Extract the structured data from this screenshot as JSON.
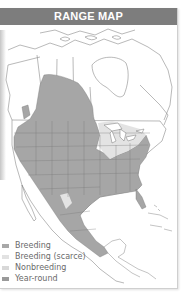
{
  "header": {
    "title": "RANGE MAP"
  },
  "legend": {
    "items": [
      {
        "label": "Breeding",
        "color": "#a8a8a8"
      },
      {
        "label": "Breeding (scarce)",
        "color": "#e2e2e2"
      },
      {
        "label": "Nonbreeding",
        "color": "#d8d8d8"
      },
      {
        "label": "Year-round",
        "color": "#9a9a9a"
      }
    ]
  },
  "colors": {
    "header_bg": "#7d7d7d",
    "range_fill": "#a6a6a6",
    "scarce_fill": "#e3e3e3",
    "border_line": "#6f6f6f"
  }
}
